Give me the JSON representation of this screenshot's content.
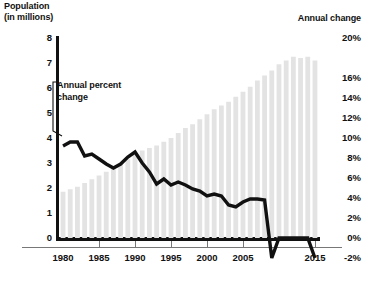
{
  "chart_data": {
    "type": "bar",
    "title": "",
    "left_axis": {
      "label": "Population (in millions)",
      "ticks": [
        0,
        1,
        2,
        3,
        4,
        5,
        6,
        7,
        8
      ],
      "tick_labels": [
        "0",
        "1",
        "2",
        "3",
        "4",
        "5",
        "6",
        "7",
        "8"
      ],
      "ylim": [
        0,
        8
      ]
    },
    "right_axis": {
      "label": "Annual change",
      "ticks": [
        -2,
        0,
        2,
        4,
        6,
        8,
        10,
        12,
        14,
        16,
        20
      ],
      "tick_labels": [
        "-2%",
        "0%",
        "2%",
        "4%",
        "6%",
        "8%",
        "10%",
        "12%",
        "14%",
        "16%",
        "20%"
      ],
      "ylim": [
        -2,
        20
      ]
    },
    "xlabel": "",
    "x_tick_labels": [
      "1980",
      "1985",
      "1990",
      "1995",
      "2000",
      "2005",
      "2015"
    ],
    "x_tick_years": [
      1980,
      1985,
      1990,
      1995,
      2000,
      2005,
      2015
    ],
    "xlim": [
      1979.3,
      2015.7
    ],
    "grid": false,
    "legend": "none",
    "annotations": [
      {
        "text": "Annual percent change",
        "points_to_year": 1981
      }
    ],
    "categories": [
      1980,
      1981,
      1982,
      1983,
      1984,
      1985,
      1986,
      1987,
      1988,
      1989,
      1990,
      1991,
      1992,
      1993,
      1994,
      1995,
      1996,
      1997,
      1998,
      1999,
      2000,
      2001,
      2002,
      2003,
      2004,
      2005,
      2006,
      2007,
      2008,
      2009,
      2010,
      2011,
      2012,
      2013,
      2014,
      2015
    ],
    "series": [
      {
        "name": "Population (in millions)",
        "type": "bar",
        "axis": "left",
        "color": "#e3e3e3",
        "values": [
          1.85,
          1.95,
          2.05,
          2.2,
          2.35,
          2.5,
          2.65,
          2.8,
          2.95,
          3.15,
          3.35,
          3.5,
          3.6,
          3.7,
          3.85,
          4.0,
          4.2,
          4.4,
          4.55,
          4.75,
          4.95,
          5.15,
          5.3,
          5.45,
          5.65,
          5.85,
          6.05,
          6.3,
          6.5,
          6.7,
          6.95,
          7.1,
          7.25,
          7.2,
          7.25,
          7.1
        ]
      },
      {
        "name": "Annual percent change",
        "type": "line",
        "axis": "right",
        "color": "#111111",
        "values": [
          9.2,
          9.6,
          9.6,
          8.2,
          8.4,
          7.9,
          7.4,
          7.0,
          7.4,
          8.1,
          8.6,
          7.5,
          6.6,
          5.4,
          5.9,
          5.3,
          5.6,
          5.3,
          4.9,
          4.7,
          4.2,
          4.4,
          4.2,
          3.3,
          3.1,
          3.6,
          3.9,
          3.9,
          3.8,
          -2.0,
          0.0,
          0.0,
          0.0,
          0.0,
          0.0,
          -2.0
        ]
      }
    ]
  }
}
